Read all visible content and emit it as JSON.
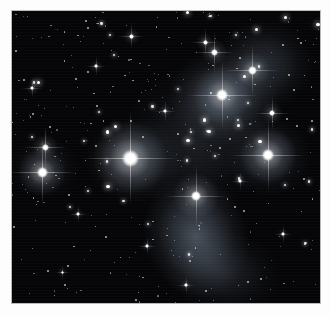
{
  "image": {
    "subject": "Pleiades open star cluster (M45)",
    "type": "astronomical photograph",
    "width": 331,
    "height": 317,
    "border": {
      "mat_color": "#fdfdfd",
      "plate_edge_color": "#b9b9b9",
      "mat_left": 12,
      "mat_top": 11,
      "mat_right": 11,
      "mat_bottom": 14
    },
    "sky": {
      "background_color": "#050507",
      "nebula_color": "#9fb4cc",
      "star_color": "#ffffff"
    }
  },
  "bright_stars": [
    {
      "name": "alcyone",
      "x": 130,
      "y": 158,
      "core": 17,
      "glow": 74,
      "spike": 96,
      "intensity": 1.0
    },
    {
      "name": "atlas",
      "x": 268,
      "y": 155,
      "core": 12,
      "glow": 56,
      "spike": 74,
      "intensity": 0.92
    },
    {
      "name": "electra",
      "x": 42,
      "y": 172,
      "core": 11,
      "glow": 48,
      "spike": 68,
      "intensity": 0.88
    },
    {
      "name": "maia",
      "x": 222,
      "y": 95,
      "core": 12,
      "glow": 58,
      "spike": 70,
      "intensity": 0.9
    },
    {
      "name": "merope",
      "x": 196,
      "y": 196,
      "core": 10,
      "glow": 46,
      "spike": 62,
      "intensity": 0.85
    },
    {
      "name": "taygeta",
      "x": 252,
      "y": 70,
      "core": 9,
      "glow": 36,
      "spike": 52,
      "intensity": 0.78
    },
    {
      "name": "celaeno",
      "x": 214,
      "y": 52,
      "core": 7,
      "glow": 26,
      "spike": 40,
      "intensity": 0.7
    },
    {
      "name": "asterope",
      "x": 45,
      "y": 147,
      "core": 7,
      "glow": 26,
      "spike": 42,
      "intensity": 0.7
    },
    {
      "name": "pleione",
      "x": 272,
      "y": 113,
      "core": 6,
      "glow": 22,
      "spike": 34,
      "intensity": 0.62
    },
    {
      "name": "atlas-companion",
      "x": 205,
      "y": 42,
      "core": 5,
      "glow": 18,
      "spike": 28,
      "intensity": 0.55
    },
    {
      "name": "field-star-a",
      "x": 131,
      "y": 36,
      "core": 5,
      "glow": 17,
      "spike": 26,
      "intensity": 0.52
    },
    {
      "name": "field-star-b",
      "x": 165,
      "y": 111,
      "core": 4,
      "glow": 14,
      "spike": 22,
      "intensity": 0.46
    },
    {
      "name": "field-star-c",
      "x": 96,
      "y": 66,
      "core": 4,
      "glow": 13,
      "spike": 20,
      "intensity": 0.44
    },
    {
      "name": "field-star-d",
      "x": 32,
      "y": 88,
      "core": 4,
      "glow": 13,
      "spike": 20,
      "intensity": 0.44
    },
    {
      "name": "field-star-e",
      "x": 283,
      "y": 234,
      "core": 4,
      "glow": 12,
      "spike": 18,
      "intensity": 0.42
    },
    {
      "name": "field-star-f",
      "x": 147,
      "y": 246,
      "core": 4,
      "glow": 12,
      "spike": 18,
      "intensity": 0.42
    },
    {
      "name": "field-star-g",
      "x": 78,
      "y": 214,
      "core": 4,
      "glow": 12,
      "spike": 18,
      "intensity": 0.42
    },
    {
      "name": "field-star-h",
      "x": 240,
      "y": 181,
      "core": 4,
      "glow": 12,
      "spike": 18,
      "intensity": 0.4
    },
    {
      "name": "field-star-i",
      "x": 186,
      "y": 285,
      "core": 4,
      "glow": 12,
      "spike": 18,
      "intensity": 0.4
    },
    {
      "name": "field-star-j",
      "x": 62,
      "y": 272,
      "core": 3,
      "glow": 10,
      "spike": 15,
      "intensity": 0.36
    }
  ],
  "nebulae": [
    {
      "name": "merope-nebula",
      "x": 196,
      "y": 236,
      "w": 104,
      "h": 126,
      "rot": -18,
      "opacity": 0.42
    },
    {
      "name": "maia-nebula",
      "x": 224,
      "y": 98,
      "w": 112,
      "h": 96,
      "rot": 12,
      "opacity": 0.34
    },
    {
      "name": "alcyone-haze",
      "x": 134,
      "y": 160,
      "w": 96,
      "h": 86,
      "rot": 0,
      "opacity": 0.26
    },
    {
      "name": "upper-right-haze",
      "x": 262,
      "y": 66,
      "w": 104,
      "h": 92,
      "rot": -8,
      "opacity": 0.24
    },
    {
      "name": "atlas-haze",
      "x": 268,
      "y": 156,
      "w": 86,
      "h": 80,
      "rot": 0,
      "opacity": 0.22
    },
    {
      "name": "central-web",
      "x": 196,
      "y": 140,
      "w": 150,
      "h": 150,
      "rot": 0,
      "opacity": 0.14
    },
    {
      "name": "lower-right-haze",
      "x": 222,
      "y": 272,
      "w": 120,
      "h": 84,
      "rot": 8,
      "opacity": 0.16
    },
    {
      "name": "electra-haze",
      "x": 44,
      "y": 168,
      "w": 70,
      "h": 64,
      "rot": 0,
      "opacity": 0.14
    }
  ],
  "field_star_count": 430
}
